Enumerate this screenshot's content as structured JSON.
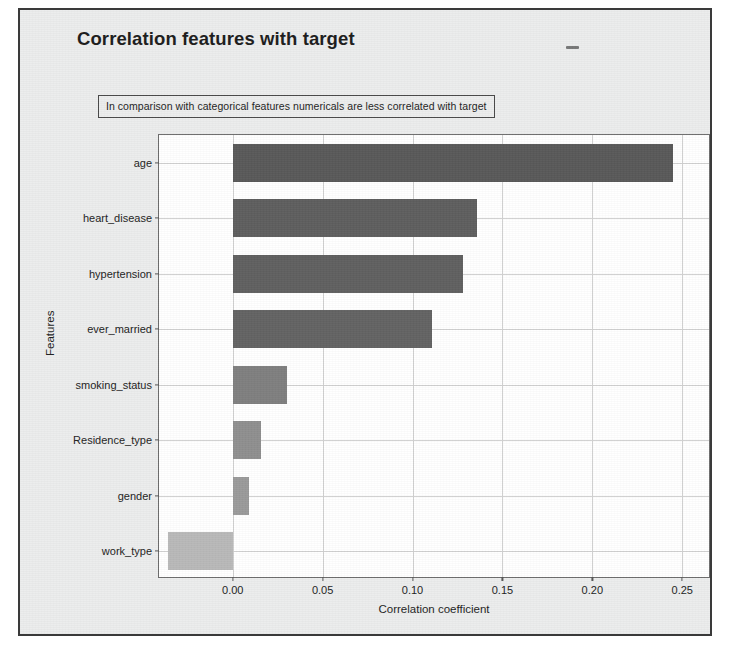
{
  "figure": {
    "title": "Correlation features with target",
    "annotation": "In comparison with categorical features numericals are less correlated with target",
    "background_color": "#eceded",
    "plot_background_color": "#ffffff",
    "frame_color": "#3a3a3a",
    "grid_color": "#cfcfcf"
  },
  "chart_data": {
    "type": "bar",
    "orientation": "horizontal",
    "title": "Correlation features with target",
    "xlabel": "Correlation coefficient",
    "ylabel": "Features",
    "categories": [
      "age",
      "heart_disease",
      "hypertension",
      "ever_married",
      "smoking_status",
      "Residence_type",
      "gender",
      "work_type"
    ],
    "values": [
      0.245,
      0.136,
      0.128,
      0.111,
      0.03,
      0.016,
      0.009,
      -0.036
    ],
    "xlim": [
      -0.041,
      0.266
    ],
    "ylim_categories": 8,
    "xticks": [
      0.0,
      0.05,
      0.1,
      0.15,
      0.2,
      0.25
    ],
    "xticklabels": [
      "0.00",
      "0.05",
      "0.10",
      "0.15",
      "0.20",
      "0.25"
    ],
    "grid": true,
    "legend": null,
    "bar_colors": [
      "#595959",
      "#5e5e5e",
      "#606060",
      "#636363",
      "#7f7f7f",
      "#8f8f8f",
      "#9a9a9a",
      "#b9b9b9"
    ],
    "annotations": [
      {
        "text": "In comparison with categorical features numericals are less correlated with target",
        "boxed": true
      }
    ]
  }
}
